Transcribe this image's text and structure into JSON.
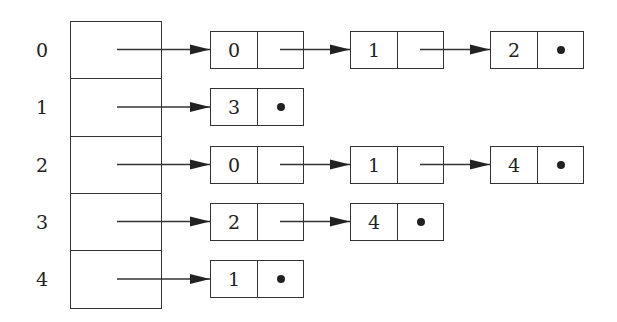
{
  "vertices": [
    {
      "index": "0",
      "list": [
        "0",
        "1",
        "2"
      ]
    },
    {
      "index": "1",
      "list": [
        "3"
      ]
    },
    {
      "index": "2",
      "list": [
        "0",
        "1",
        "4"
      ]
    },
    {
      "index": "3",
      "list": [
        "2",
        "4"
      ]
    },
    {
      "index": "4",
      "list": [
        "1"
      ]
    }
  ],
  "null_marker": "null-pointer-dot",
  "colors": {
    "stroke": "#333333",
    "text": "#222222",
    "background": "#ffffff"
  }
}
